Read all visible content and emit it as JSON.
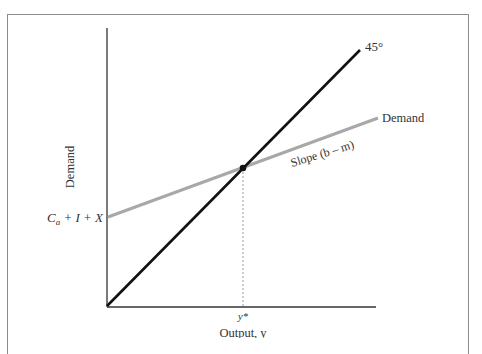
{
  "diagram": {
    "type": "keynesian-cross",
    "y_axis_label": "Demand",
    "x_axis_label": "Output, y",
    "intercept_label": {
      "main": "C",
      "sub": "a",
      "rest": " + I + X"
    },
    "line_45_label": "45°",
    "demand_line_label": "Demand",
    "slope_label": "Slope (b – m)",
    "equilibrium_label": "y*",
    "colors": {
      "line_45": "#111111",
      "demand_line": "#a8a8a8",
      "axes": "#333333",
      "frame": "#8c8c8c",
      "dashed": "#999999"
    }
  }
}
